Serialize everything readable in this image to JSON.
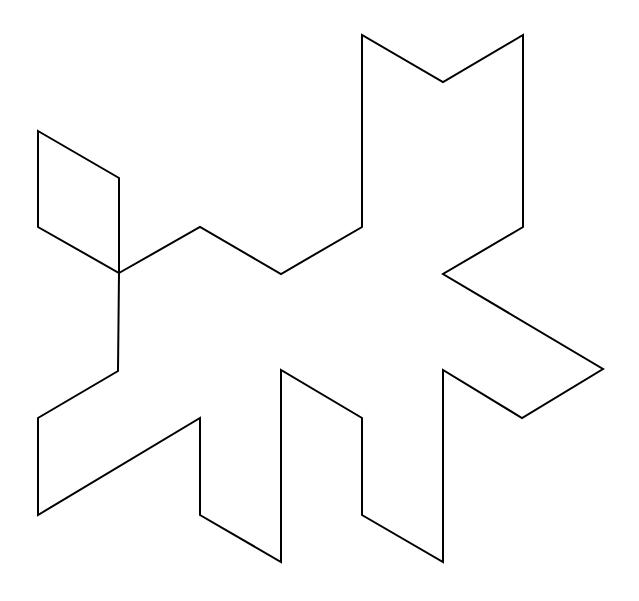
{
  "figure": {
    "width": 639,
    "height": 601,
    "background": "#ffffff",
    "stroke_color": "#000000",
    "stroke_width": 2,
    "shapes": [
      {
        "name": "rhombus",
        "points": "38,131 119,178 119,273 38,227"
      },
      {
        "name": "main-outline",
        "points": "119,273 200,227 281,274 362,227 362,35 443,82 523,35 523,227 443,274 603,369 522,418 443,370 443,562 362,515 362,418 281,370 281,562 200,515 200,418 38,515 38,418 118,371"
      }
    ]
  }
}
